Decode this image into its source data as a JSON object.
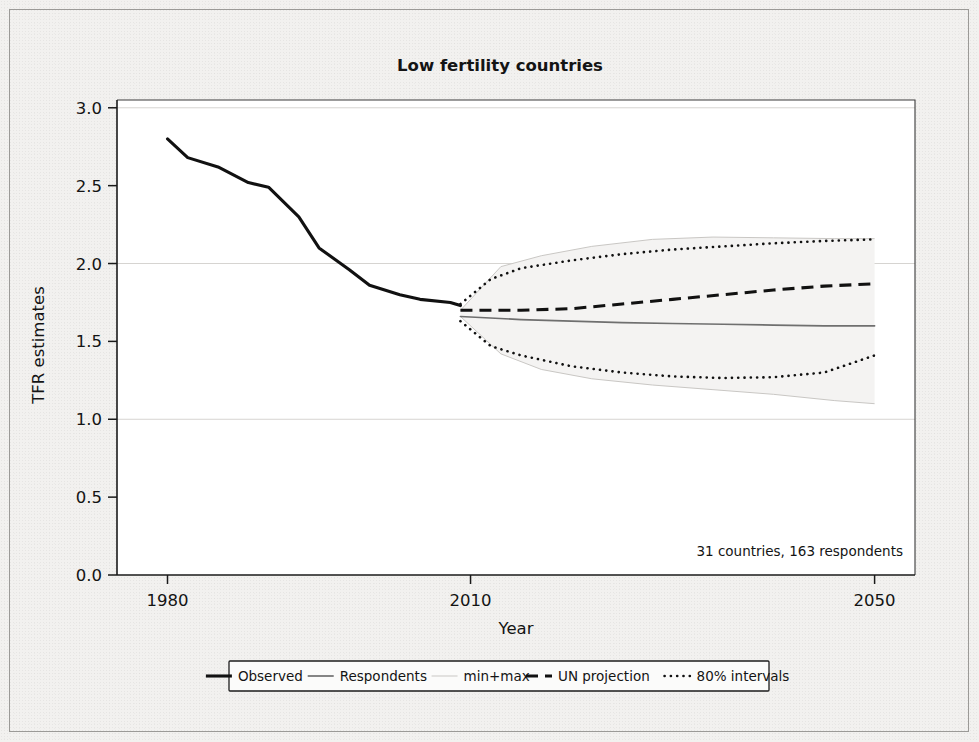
{
  "chart_data": {
    "type": "line",
    "title": "Low fertility countries",
    "xlabel": "Year",
    "ylabel": "TFR estimates",
    "annotation": "31 countries, 163 respondents",
    "xlim": [
      1975,
      2054
    ],
    "ylim": [
      0.0,
      3.05
    ],
    "xticks": [
      1980,
      2010,
      2050
    ],
    "xticklabels": [
      "1980",
      "2010",
      "2050"
    ],
    "yticks": [
      0.0,
      0.5,
      1.0,
      1.5,
      2.0,
      2.5,
      3.0
    ],
    "yticklabels": [
      "0.0",
      "0.5",
      "1.0",
      "1.5",
      "2.0",
      "2.5",
      "3.0"
    ],
    "gridlines_y": [
      1.0,
      2.0,
      3.0
    ],
    "grid": "horizontal-major-only",
    "legend_position": "below-axes",
    "series": [
      {
        "name": "Observed",
        "style": "solid-thick-black",
        "color": "#111111",
        "x": [
          1980,
          1982,
          1985,
          1988,
          1990,
          1993,
          1995,
          1998,
          2000,
          2003,
          2005,
          2008,
          2009
        ],
        "y": [
          2.8,
          2.68,
          2.62,
          2.52,
          2.49,
          2.3,
          2.1,
          1.96,
          1.86,
          1.8,
          1.77,
          1.75,
          1.73
        ]
      },
      {
        "name": "Respondents",
        "style": "solid-thin-gray",
        "color": "#6f6f6f",
        "x": [
          2009,
          2015,
          2020,
          2025,
          2030,
          2035,
          2040,
          2045,
          2050
        ],
        "y": [
          1.66,
          1.64,
          1.63,
          1.62,
          1.615,
          1.61,
          1.605,
          1.6,
          1.6
        ]
      },
      {
        "name": "UN projection",
        "style": "dashed-black",
        "color": "#111111",
        "x": [
          2009,
          2015,
          2020,
          2025,
          2030,
          2035,
          2040,
          2045,
          2050
        ],
        "y": [
          1.7,
          1.7,
          1.71,
          1.74,
          1.77,
          1.8,
          1.83,
          1.855,
          1.87
        ]
      },
      {
        "name": "80% intervals",
        "style": "dotted-black",
        "color": "#111111",
        "bounds": "upper-and-lower",
        "x": [
          2009,
          2012,
          2015,
          2020,
          2025,
          2030,
          2035,
          2040,
          2045,
          2050
        ],
        "upper": [
          1.74,
          1.9,
          1.97,
          2.02,
          2.06,
          2.09,
          2.11,
          2.13,
          2.145,
          2.155
        ],
        "lower": [
          1.63,
          1.47,
          1.41,
          1.34,
          1.3,
          1.275,
          1.265,
          1.27,
          1.3,
          1.41
        ]
      },
      {
        "name": "min+max",
        "style": "solid-hairline-lightgray",
        "color": "#c9c7c4",
        "bounds": "upper-and-lower",
        "x": [
          2009,
          2013,
          2017,
          2022,
          2028,
          2034,
          2040,
          2046,
          2050
        ],
        "upper": [
          1.7,
          1.98,
          2.05,
          2.11,
          2.155,
          2.17,
          2.165,
          2.16,
          2.16
        ],
        "lower": [
          1.66,
          1.42,
          1.32,
          1.26,
          1.22,
          1.19,
          1.16,
          1.12,
          1.1
        ]
      }
    ],
    "legend_entries": [
      {
        "label": "Observed",
        "style": "solid-thick-black",
        "color": "#111111"
      },
      {
        "label": "Respondents",
        "style": "solid-thin-gray",
        "color": "#6f6f6f"
      },
      {
        "label": "min+max",
        "style": "solid-hairline-lightgray",
        "color": "#c9c7c4"
      },
      {
        "label": "UN projection",
        "style": "dashed-black",
        "color": "#111111"
      },
      {
        "label": "80% intervals",
        "style": "dotted-black",
        "color": "#111111"
      }
    ]
  }
}
